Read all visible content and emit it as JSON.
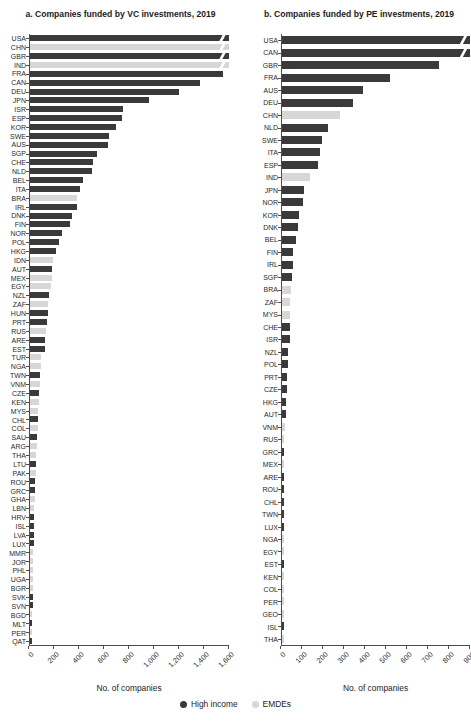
{
  "colors": {
    "high_income": "#3b393b",
    "emde": "#d8d7d5",
    "axis": "#4d4c4e"
  },
  "legend": {
    "items": [
      {
        "label": "High income",
        "color": "#3b393b"
      },
      {
        "label": "EMDEs",
        "color": "#d8d7d5"
      }
    ]
  },
  "chart_data": [
    {
      "type": "bar",
      "orientation": "horizontal",
      "title": "a. Companies funded by VC investments, 2019",
      "xlabel": "No. of companies",
      "xlim": [
        0,
        1600
      ],
      "xticks": [
        "0",
        "200",
        "400",
        "600",
        "800",
        "1,000",
        "1,200",
        "1,400",
        "1,600"
      ],
      "note": "bars marked truncated extend beyond the axis maximum (break marks)",
      "rows": [
        {
          "code": "USA",
          "value": 1600,
          "group": "high_income",
          "truncated": true
        },
        {
          "code": "CHN",
          "value": 1600,
          "group": "emde",
          "truncated": true
        },
        {
          "code": "GBR",
          "value": 1600,
          "group": "high_income",
          "truncated": true
        },
        {
          "code": "IND",
          "value": 1600,
          "group": "emde",
          "truncated": true
        },
        {
          "code": "FRA",
          "value": 1550,
          "group": "high_income"
        },
        {
          "code": "CAN",
          "value": 1370,
          "group": "high_income"
        },
        {
          "code": "DEU",
          "value": 1200,
          "group": "high_income"
        },
        {
          "code": "JPN",
          "value": 960,
          "group": "high_income"
        },
        {
          "code": "ISR",
          "value": 750,
          "group": "high_income"
        },
        {
          "code": "ESP",
          "value": 740,
          "group": "high_income"
        },
        {
          "code": "KOR",
          "value": 690,
          "group": "high_income"
        },
        {
          "code": "SWE",
          "value": 635,
          "group": "high_income"
        },
        {
          "code": "AUS",
          "value": 625,
          "group": "high_income"
        },
        {
          "code": "SGP",
          "value": 535,
          "group": "high_income"
        },
        {
          "code": "CHE",
          "value": 505,
          "group": "high_income"
        },
        {
          "code": "NLD",
          "value": 495,
          "group": "high_income"
        },
        {
          "code": "BEL",
          "value": 430,
          "group": "high_income"
        },
        {
          "code": "ITA",
          "value": 400,
          "group": "high_income"
        },
        {
          "code": "BRA",
          "value": 380,
          "group": "emde"
        },
        {
          "code": "IRL",
          "value": 375,
          "group": "high_income"
        },
        {
          "code": "DNK",
          "value": 335,
          "group": "high_income"
        },
        {
          "code": "FIN",
          "value": 320,
          "group": "high_income"
        },
        {
          "code": "NOR",
          "value": 255,
          "group": "high_income"
        },
        {
          "code": "POL",
          "value": 230,
          "group": "high_income"
        },
        {
          "code": "HKG",
          "value": 210,
          "group": "high_income"
        },
        {
          "code": "IDN",
          "value": 185,
          "group": "emde"
        },
        {
          "code": "AUT",
          "value": 180,
          "group": "high_income"
        },
        {
          "code": "MEX",
          "value": 175,
          "group": "emde"
        },
        {
          "code": "EGY",
          "value": 165,
          "group": "emde"
        },
        {
          "code": "NZL",
          "value": 150,
          "group": "high_income"
        },
        {
          "code": "ZAF",
          "value": 145,
          "group": "emde"
        },
        {
          "code": "HUN",
          "value": 142,
          "group": "high_income"
        },
        {
          "code": "PRT",
          "value": 138,
          "group": "high_income"
        },
        {
          "code": "RUS",
          "value": 125,
          "group": "emde"
        },
        {
          "code": "ARE",
          "value": 122,
          "group": "high_income"
        },
        {
          "code": "EST",
          "value": 118,
          "group": "high_income"
        },
        {
          "code": "TUR",
          "value": 92,
          "group": "emde"
        },
        {
          "code": "NGA",
          "value": 88,
          "group": "emde"
        },
        {
          "code": "TWN",
          "value": 82,
          "group": "high_income"
        },
        {
          "code": "VNM",
          "value": 78,
          "group": "emde"
        },
        {
          "code": "CZE",
          "value": 76,
          "group": "high_income"
        },
        {
          "code": "KEN",
          "value": 72,
          "group": "emde"
        },
        {
          "code": "MYS",
          "value": 68,
          "group": "emde"
        },
        {
          "code": "CHL",
          "value": 66,
          "group": "high_income"
        },
        {
          "code": "COL",
          "value": 62,
          "group": "emde"
        },
        {
          "code": "SAU",
          "value": 60,
          "group": "high_income"
        },
        {
          "code": "ARG",
          "value": 55,
          "group": "emde"
        },
        {
          "code": "THA",
          "value": 52,
          "group": "emde"
        },
        {
          "code": "LTU",
          "value": 50,
          "group": "high_income"
        },
        {
          "code": "PAK",
          "value": 46,
          "group": "emde"
        },
        {
          "code": "ROU",
          "value": 44,
          "group": "high_income"
        },
        {
          "code": "GRC",
          "value": 42,
          "group": "high_income"
        },
        {
          "code": "GHA",
          "value": 38,
          "group": "emde"
        },
        {
          "code": "LBN",
          "value": 36,
          "group": "emde"
        },
        {
          "code": "HRV",
          "value": 34,
          "group": "high_income"
        },
        {
          "code": "ISL",
          "value": 32,
          "group": "high_income"
        },
        {
          "code": "LVA",
          "value": 30,
          "group": "high_income"
        },
        {
          "code": "LUX",
          "value": 29,
          "group": "high_income"
        },
        {
          "code": "MMR",
          "value": 27,
          "group": "emde"
        },
        {
          "code": "JOR",
          "value": 26,
          "group": "emde"
        },
        {
          "code": "PHL",
          "value": 25,
          "group": "emde"
        },
        {
          "code": "UGA",
          "value": 24,
          "group": "emde"
        },
        {
          "code": "BGR",
          "value": 23,
          "group": "emde"
        },
        {
          "code": "SVK",
          "value": 22,
          "group": "high_income"
        },
        {
          "code": "SVN",
          "value": 21,
          "group": "high_income"
        },
        {
          "code": "BGD",
          "value": 19,
          "group": "emde"
        },
        {
          "code": "MLT",
          "value": 18,
          "group": "high_income"
        },
        {
          "code": "PER",
          "value": 16,
          "group": "emde"
        },
        {
          "code": "QAT",
          "value": 15,
          "group": "high_income"
        }
      ]
    },
    {
      "type": "bar",
      "orientation": "horizontal",
      "title": "b. Companies funded by PE investments, 2019",
      "xlabel": "No. of companies",
      "xlim": [
        0,
        900
      ],
      "xticks": [
        "0",
        "100",
        "200",
        "300",
        "400",
        "500",
        "600",
        "700",
        "800",
        "900"
      ],
      "note": "bars marked truncated extend beyond the axis maximum (break marks)",
      "rows": [
        {
          "code": "USA",
          "value": 900,
          "group": "high_income",
          "truncated": true
        },
        {
          "code": "CAN",
          "value": 900,
          "group": "high_income",
          "truncated": true
        },
        {
          "code": "GBR",
          "value": 750,
          "group": "high_income"
        },
        {
          "code": "FRA",
          "value": 515,
          "group": "high_income"
        },
        {
          "code": "AUS",
          "value": 390,
          "group": "high_income"
        },
        {
          "code": "DEU",
          "value": 340,
          "group": "high_income"
        },
        {
          "code": "CHN",
          "value": 280,
          "group": "emde"
        },
        {
          "code": "NLD",
          "value": 220,
          "group": "high_income"
        },
        {
          "code": "SWE",
          "value": 190,
          "group": "high_income"
        },
        {
          "code": "ITA",
          "value": 183,
          "group": "high_income"
        },
        {
          "code": "ESP",
          "value": 170,
          "group": "high_income"
        },
        {
          "code": "IND",
          "value": 135,
          "group": "emde"
        },
        {
          "code": "JPN",
          "value": 106,
          "group": "high_income"
        },
        {
          "code": "NOR",
          "value": 101,
          "group": "high_income"
        },
        {
          "code": "KOR",
          "value": 83,
          "group": "high_income"
        },
        {
          "code": "DNK",
          "value": 77,
          "group": "high_income"
        },
        {
          "code": "BEL",
          "value": 69,
          "group": "high_income"
        },
        {
          "code": "FIN",
          "value": 54,
          "group": "high_income"
        },
        {
          "code": "IRL",
          "value": 53,
          "group": "high_income"
        },
        {
          "code": "SGP",
          "value": 47,
          "group": "high_income"
        },
        {
          "code": "BRA",
          "value": 42,
          "group": "emde"
        },
        {
          "code": "ZAF",
          "value": 40,
          "group": "emde"
        },
        {
          "code": "MYS",
          "value": 38,
          "group": "emde"
        },
        {
          "code": "CHE",
          "value": 37,
          "group": "high_income"
        },
        {
          "code": "ISR",
          "value": 36,
          "group": "high_income"
        },
        {
          "code": "NZL",
          "value": 30,
          "group": "high_income"
        },
        {
          "code": "POL",
          "value": 29,
          "group": "high_income"
        },
        {
          "code": "PRT",
          "value": 24,
          "group": "high_income"
        },
        {
          "code": "CZE",
          "value": 23,
          "group": "high_income"
        },
        {
          "code": "HKG",
          "value": 20,
          "group": "high_income"
        },
        {
          "code": "AUT",
          "value": 19,
          "group": "high_income"
        },
        {
          "code": "VNM",
          "value": 12,
          "group": "emde"
        },
        {
          "code": "RUS",
          "value": 11,
          "group": "emde"
        },
        {
          "code": "GRC",
          "value": 10,
          "group": "high_income"
        },
        {
          "code": "MEX",
          "value": 9,
          "group": "emde"
        },
        {
          "code": "ARE",
          "value": 9,
          "group": "high_income"
        },
        {
          "code": "ROU",
          "value": 8,
          "group": "high_income"
        },
        {
          "code": "CHL",
          "value": 8,
          "group": "high_income"
        },
        {
          "code": "TWN",
          "value": 8,
          "group": "high_income"
        },
        {
          "code": "LUX",
          "value": 7,
          "group": "high_income"
        },
        {
          "code": "NGA",
          "value": 6,
          "group": "emde"
        },
        {
          "code": "EGY",
          "value": 6,
          "group": "emde"
        },
        {
          "code": "EST",
          "value": 6,
          "group": "high_income"
        },
        {
          "code": "KEN",
          "value": 5,
          "group": "emde"
        },
        {
          "code": "COL",
          "value": 5,
          "group": "emde"
        },
        {
          "code": "PER",
          "value": 4,
          "group": "emde"
        },
        {
          "code": "GEO",
          "value": 4,
          "group": "emde"
        },
        {
          "code": "ISL",
          "value": 4,
          "group": "high_income"
        },
        {
          "code": "THA",
          "value": 3,
          "group": "emde"
        }
      ]
    }
  ]
}
